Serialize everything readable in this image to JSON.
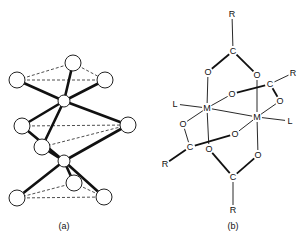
{
  "figure_a": {
    "caption": "(a)",
    "atoms": [
      {
        "id": "t1",
        "x": 73,
        "y": 63,
        "r": 8
      },
      {
        "id": "t2",
        "x": 17,
        "y": 80,
        "r": 8
      },
      {
        "id": "t3",
        "x": 105,
        "y": 80,
        "r": 8
      },
      {
        "id": "m1",
        "x": 64,
        "y": 101,
        "r": 6
      },
      {
        "id": "c1",
        "x": 22,
        "y": 126,
        "r": 8
      },
      {
        "id": "c2",
        "x": 128,
        "y": 125,
        "r": 8
      },
      {
        "id": "c3",
        "x": 42,
        "y": 147,
        "r": 8
      },
      {
        "id": "m2",
        "x": 64,
        "y": 161,
        "r": 6
      },
      {
        "id": "b1",
        "x": 74,
        "y": 183,
        "r": 8
      },
      {
        "id": "b2",
        "x": 17,
        "y": 198,
        "r": 8
      },
      {
        "id": "b3",
        "x": 104,
        "y": 197,
        "r": 8
      }
    ],
    "bonds": [
      [
        "m1",
        "t1"
      ],
      [
        "m1",
        "t2"
      ],
      [
        "m1",
        "t3"
      ],
      [
        "m1",
        "c1"
      ],
      [
        "m1",
        "c2"
      ],
      [
        "m1",
        "c3"
      ],
      [
        "m2",
        "c1"
      ],
      [
        "m2",
        "c2"
      ],
      [
        "m2",
        "c3"
      ],
      [
        "m2",
        "b1"
      ],
      [
        "m2",
        "b2"
      ],
      [
        "m2",
        "b3"
      ]
    ],
    "dashed": [
      [
        "t1",
        "t2"
      ],
      [
        "t1",
        "t3"
      ],
      [
        "t2",
        "t3"
      ],
      [
        "c1",
        "c2"
      ],
      [
        "c2",
        "c3"
      ],
      [
        "b1",
        "b2"
      ],
      [
        "b1",
        "b3"
      ],
      [
        "b2",
        "b3"
      ]
    ]
  },
  "figure_b": {
    "caption": "(b)",
    "atoms": [
      {
        "id": "R_top",
        "label": "R",
        "x": 232,
        "y": 14
      },
      {
        "id": "C_top",
        "label": "C",
        "x": 233,
        "y": 51
      },
      {
        "id": "O_tl",
        "label": "O",
        "x": 208,
        "y": 72
      },
      {
        "id": "O_tr",
        "label": "O",
        "x": 257,
        "y": 75
      },
      {
        "id": "R_right",
        "label": "R",
        "x": 293,
        "y": 73
      },
      {
        "id": "C_right",
        "label": "C",
        "x": 270,
        "y": 84
      },
      {
        "id": "O_mid_up",
        "label": "O",
        "x": 232,
        "y": 94
      },
      {
        "id": "O_right",
        "label": "O",
        "x": 280,
        "y": 101
      },
      {
        "id": "L_left",
        "label": "L",
        "x": 175,
        "y": 104
      },
      {
        "id": "M_left",
        "label": "M",
        "x": 207,
        "y": 108
      },
      {
        "id": "M_right",
        "label": "M",
        "x": 257,
        "y": 117
      },
      {
        "id": "L_right",
        "label": "L",
        "x": 290,
        "y": 121
      },
      {
        "id": "O_left",
        "label": "O",
        "x": 183,
        "y": 124
      },
      {
        "id": "O_mid_low",
        "label": "O",
        "x": 235,
        "y": 134
      },
      {
        "id": "C_left",
        "label": "C",
        "x": 190,
        "y": 147
      },
      {
        "id": "O_bl",
        "label": "O",
        "x": 209,
        "y": 149
      },
      {
        "id": "O_br",
        "label": "O",
        "x": 258,
        "y": 155
      },
      {
        "id": "R_left",
        "label": "R",
        "x": 165,
        "y": 164
      },
      {
        "id": "C_bottom",
        "label": "C",
        "x": 233,
        "y": 177
      },
      {
        "id": "R_bottom",
        "label": "R",
        "x": 233,
        "y": 210
      }
    ],
    "bonds": [
      [
        "R_top",
        "C_top",
        1
      ],
      [
        "C_top",
        "O_tl",
        2
      ],
      [
        "C_top",
        "O_tr",
        2
      ],
      [
        "O_tl",
        "M_left",
        1
      ],
      [
        "O_tr",
        "M_right",
        1
      ],
      [
        "R_right",
        "C_right",
        1
      ],
      [
        "C_right",
        "O_mid_up",
        2
      ],
      [
        "C_right",
        "O_right",
        2
      ],
      [
        "O_mid_up",
        "M_left",
        1
      ],
      [
        "O_right",
        "M_right",
        1
      ],
      [
        "L_left",
        "M_left",
        1
      ],
      [
        "M_left",
        "M_right",
        1
      ],
      [
        "M_right",
        "L_right",
        1
      ],
      [
        "M_left",
        "O_left",
        1
      ],
      [
        "O_left",
        "C_left",
        1
      ],
      [
        "C_left",
        "O_mid_low",
        2
      ],
      [
        "O_mid_low",
        "M_right",
        1
      ],
      [
        "R_left",
        "C_left",
        2
      ],
      [
        "M_left",
        "O_bl",
        1
      ],
      [
        "M_right",
        "O_br",
        1
      ],
      [
        "O_bl",
        "C_bottom",
        2
      ],
      [
        "O_br",
        "C_bottom",
        2
      ],
      [
        "C_bottom",
        "R_bottom",
        1
      ]
    ]
  }
}
